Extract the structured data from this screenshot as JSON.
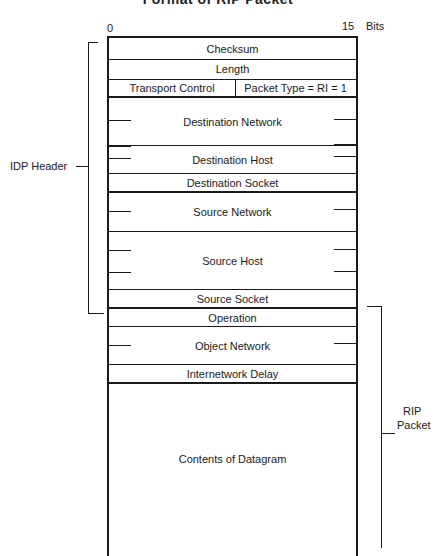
{
  "title": "Format of RIP Packet",
  "bit_scale": {
    "start": "0",
    "end": "15",
    "unit": "Bits"
  },
  "fields": [
    {
      "label": "Checksum"
    },
    {
      "label": "Length"
    },
    {
      "label_left": "Transport Control",
      "label_right": "Packet Type = RI = 1"
    },
    {
      "label": "Destination Network"
    },
    {
      "label": "Destination Host"
    },
    {
      "label": "Destination Socket"
    },
    {
      "label": "Source Network"
    },
    {
      "label": "Source Host"
    },
    {
      "label": "Source Socket"
    },
    {
      "label": "Operation"
    },
    {
      "label": "Object Network"
    },
    {
      "label": "Internetwork Delay"
    },
    {
      "label": "Contents of Datagram"
    }
  ],
  "brackets": {
    "idp_header": {
      "label": "IDP Header"
    },
    "rip_packet": {
      "label_line1": "RIP",
      "label_line2": "Packet"
    }
  }
}
